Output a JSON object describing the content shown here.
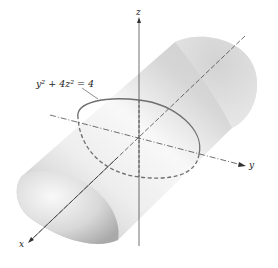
{
  "figure": {
    "equation_label": "y² + 4z² = 4",
    "axes": {
      "x_label": "x",
      "y_label": "y",
      "z_label": "z"
    },
    "colors": {
      "surface_light": "#f4f4f4",
      "surface_dark": "#b8b8b8",
      "trace_curve": "#6e6e6e",
      "axis": "#333333"
    }
  }
}
